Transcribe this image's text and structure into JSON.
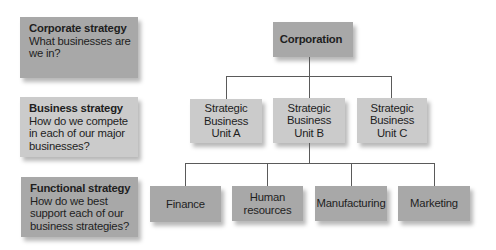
{
  "levels": [
    {
      "title": "Corporate strategy",
      "description": "What businesses are we in?",
      "color": "#a8a8a8"
    },
    {
      "title": "Business strategy",
      "description": "How do we compete in each of our major businesses?",
      "color": "#cbcbcb"
    },
    {
      "title": "Functional strategy",
      "description": "How do we best support each of our business strategies?",
      "color": "#a8a8a8"
    }
  ],
  "root": {
    "label": "Corporation",
    "color": "#a8a8a8"
  },
  "business_units": [
    {
      "label": "Strategic Business Unit A"
    },
    {
      "label": "Strategic Business Unit B"
    },
    {
      "label": "Strategic Business Unit C"
    }
  ],
  "functions": [
    {
      "label": "Finance"
    },
    {
      "label": "Human resources"
    },
    {
      "label": "Manufacturing"
    },
    {
      "label": "Marketing"
    }
  ],
  "colors": {
    "dark_box": "#a8a8a8",
    "light_box": "#cbcbcb",
    "connector": "#5a5a5a"
  }
}
